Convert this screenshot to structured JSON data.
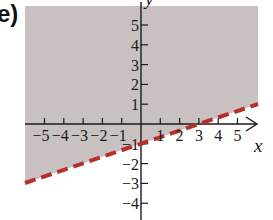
{
  "panel_label": "e)",
  "chart_data": {
    "type": "area",
    "title": "",
    "panel_label": "e)",
    "xlabel": "x",
    "ylabel": "y",
    "xlim": [
      -6,
      6
    ],
    "ylim": [
      -5,
      6
    ],
    "grid": false,
    "x_ticks": [
      -5,
      -4,
      -3,
      -2,
      -1,
      1,
      2,
      3,
      4,
      5
    ],
    "y_ticks": [
      5,
      4,
      3,
      2,
      1,
      -1,
      -2,
      -3,
      -4
    ],
    "x_tick_labels": [
      "−5",
      "−4",
      "−3",
      "−2",
      "−1",
      "1",
      "2",
      "3",
      "4",
      "5"
    ],
    "y_tick_labels": [
      "5",
      "4",
      "3",
      "2",
      "1",
      "−1",
      "−2",
      "−3",
      "−4"
    ],
    "boundary": {
      "equation": "y = (1/3)x - 1",
      "style": "dashed",
      "color": "#b5302a",
      "points": [
        [
          -6,
          -3
        ],
        [
          6,
          1
        ]
      ],
      "x_intercept": 3,
      "y_intercept": -1
    },
    "shaded_region": {
      "inequality": "y > (1/3)x - 1",
      "side": "above",
      "color": "#c9c0c0"
    },
    "legend": null
  },
  "colors": {
    "shade": "#c9c1c1",
    "boundary": "#b5302a",
    "axis": "#1a1a1a"
  }
}
